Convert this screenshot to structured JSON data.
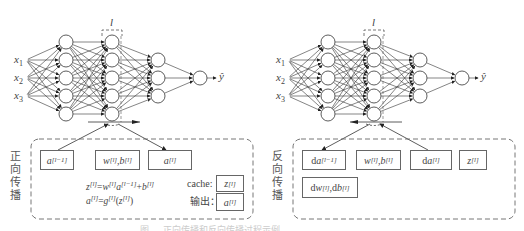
{
  "forward_panel": {
    "side_label": [
      "正",
      "向",
      "传",
      "播"
    ],
    "layer_label": "l",
    "inputs": [
      "x1",
      "x2",
      "x3"
    ],
    "output_label": "ŷ",
    "boxes": [
      {
        "base": "a",
        "sup": "[l−1]"
      },
      {
        "base1": "w",
        "sup1": "[l]",
        "sep": ", ",
        "base2": "b",
        "sup2": "[l]"
      },
      {
        "base": "a",
        "sup": "[l]"
      }
    ],
    "formula1": {
      "z": "z",
      "zs": "[l]",
      "eq": "=",
      "w": "w",
      "ws": "[l]",
      "a": "a",
      "as": "[l−1]",
      "plus": "+",
      "b": "b",
      "bs": "[l]"
    },
    "formula2": {
      "a": "a",
      "as": "[l]",
      "eq": "=",
      "g": "g",
      "gs": "[l]",
      "open": "(",
      "z": "z",
      "zs": "[l]",
      "close": ")"
    },
    "cache_label": "cache:",
    "cache_box": {
      "base": "z",
      "sup": "[l]"
    },
    "output_text": "输出：",
    "output_box": {
      "base": "a",
      "sup": "[l]"
    }
  },
  "backward_panel": {
    "side_label": [
      "反",
      "向",
      "传",
      "播"
    ],
    "layer_label": "l",
    "inputs": [
      "x1",
      "x2",
      "x3"
    ],
    "output_label": "ŷ",
    "boxes": [
      {
        "pre": "d",
        "base": "a",
        "sup": "[l−1]"
      },
      {
        "base1": "w",
        "sup1": "[l]",
        "sep": ", ",
        "base2": "b",
        "sup2": "[l]"
      },
      {
        "pre": "d",
        "base": "a",
        "sup": "[l]"
      },
      {
        "base": "z",
        "sup": "[l]"
      },
      {
        "pre1": "d",
        "base1": "w",
        "sup1": "[l]",
        "sep": ", ",
        "pre2": "d",
        "base2": "b",
        "sup2": "[l]"
      }
    ]
  },
  "caption": "图 ...  正向传播和反向传播过程示例",
  "colors": {
    "line": "#333333",
    "dashed": "#666666",
    "node_fill": "#ffffff"
  }
}
